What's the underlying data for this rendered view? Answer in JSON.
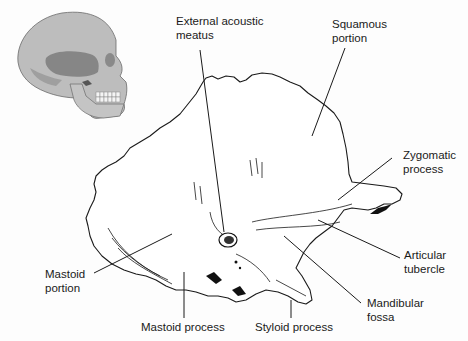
{
  "diagram": {
    "inset": "skull-with-temporal-bone-highlighted",
    "colors": {
      "line": "#1a1a1a",
      "bone_fill": "#ffffff",
      "skull_fill": "#b8b8b8",
      "skull_highlight": "#7a7a7a",
      "background": "#fdfdfd"
    }
  },
  "labels": {
    "external_acoustic_meatus": {
      "line1": "External acoustic",
      "line2": "meatus"
    },
    "squamous_portion": {
      "line1": "Squamous",
      "line2": "portion"
    },
    "zygomatic_process": {
      "line1": "Zygomatic",
      "line2": "process"
    },
    "articular_tubercle": {
      "line1": "Articular",
      "line2": "tubercle"
    },
    "mandibular_fossa": {
      "line1": "Mandibular",
      "line2": "fossa"
    },
    "mastoid_portion": {
      "line1": "Mastoid",
      "line2": "portion"
    },
    "mastoid_process": {
      "line1": "Mastoid process"
    },
    "styloid_process": {
      "line1": "Styloid process"
    }
  }
}
